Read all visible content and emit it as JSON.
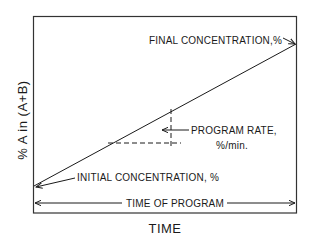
{
  "diagram": {
    "type": "gradient-elution-program",
    "y_axis_label": "% A in (A+B)",
    "x_axis_label": "TIME",
    "annotations": {
      "final": "FINAL CONCENTRATION,%",
      "initial": "INITIAL CONCENTRATION, %",
      "rate_line1": "PROGRAM RATE,",
      "rate_line2": "%/min.",
      "duration": "TIME OF PROGRAM"
    },
    "colors": {
      "ink": "#1a1a1a",
      "background": "#ffffff"
    }
  }
}
